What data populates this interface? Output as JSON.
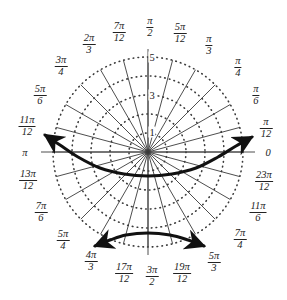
{
  "figure": {
    "center": {
      "x": 148,
      "y": 152
    },
    "outer_radius": 95,
    "colors": {
      "grid": "#3a3a3a",
      "curve": "#111111",
      "text": "#222222",
      "background": "#ffffff"
    }
  },
  "chart_data": {
    "type": "line",
    "coordinate_system": "polar",
    "title": "",
    "xlabel": "",
    "ylabel": "",
    "angle_unit": "radians",
    "grid": true,
    "legend": null,
    "radial_ticks": [
      {
        "value": 1,
        "label": "1"
      },
      {
        "value": 2,
        "label": ""
      },
      {
        "value": 3,
        "label": "3"
      },
      {
        "value": 4,
        "label": ""
      },
      {
        "value": 5,
        "label": "5"
      }
    ],
    "rlim": [
      0,
      5
    ],
    "angular_tick_count": 24,
    "angular_ticks": [
      {
        "angle_deg": 0,
        "label_num": "0",
        "label_den": ""
      },
      {
        "angle_deg": 15,
        "label_num": "π",
        "label_den": "12"
      },
      {
        "angle_deg": 30,
        "label_num": "π",
        "label_den": "6"
      },
      {
        "angle_deg": 45,
        "label_num": "π",
        "label_den": "4"
      },
      {
        "angle_deg": 60,
        "label_num": "π",
        "label_den": "3"
      },
      {
        "angle_deg": 75,
        "label_num": "5π",
        "label_den": "12"
      },
      {
        "angle_deg": 90,
        "label_num": "π",
        "label_den": "2"
      },
      {
        "angle_deg": 105,
        "label_num": "7π",
        "label_den": "12"
      },
      {
        "angle_deg": 120,
        "label_num": "2π",
        "label_den": "3"
      },
      {
        "angle_deg": 135,
        "label_num": "3π",
        "label_den": "4"
      },
      {
        "angle_deg": 150,
        "label_num": "5π",
        "label_den": "6"
      },
      {
        "angle_deg": 165,
        "label_num": "11π",
        "label_den": "12"
      },
      {
        "angle_deg": 180,
        "label_num": "π",
        "label_den": ""
      },
      {
        "angle_deg": 195,
        "label_num": "13π",
        "label_den": "12"
      },
      {
        "angle_deg": 210,
        "label_num": "7π",
        "label_den": "6"
      },
      {
        "angle_deg": 225,
        "label_num": "5π",
        "label_den": "4"
      },
      {
        "angle_deg": 240,
        "label_num": "4π",
        "label_den": "3"
      },
      {
        "angle_deg": 255,
        "label_num": "17π",
        "label_den": "12"
      },
      {
        "angle_deg": 270,
        "label_num": "3π",
        "label_den": "2"
      },
      {
        "angle_deg": 285,
        "label_num": "19π",
        "label_den": "12"
      },
      {
        "angle_deg": 300,
        "label_num": "5π",
        "label_den": "3"
      },
      {
        "angle_deg": 315,
        "label_num": "7π",
        "label_den": "4"
      },
      {
        "angle_deg": 330,
        "label_num": "11π",
        "label_den": "6"
      },
      {
        "angle_deg": 345,
        "label_num": "23π",
        "label_den": "12"
      }
    ],
    "curves": [
      {
        "name": "upper-branch",
        "arrow_start": true,
        "arrow_end": true,
        "points_px": [
          [
            45,
            135
          ],
          [
            60,
            145
          ],
          [
            78,
            157
          ],
          [
            100,
            168
          ],
          [
            124,
            174
          ],
          [
            148,
            176
          ],
          [
            172,
            174
          ],
          [
            196,
            168
          ],
          [
            218,
            157
          ],
          [
            236,
            146
          ],
          [
            252,
            137
          ]
        ]
      },
      {
        "name": "lower-branch",
        "arrow_start": true,
        "arrow_end": true,
        "points_px": [
          [
            95,
            246
          ],
          [
            110,
            240
          ],
          [
            126,
            235
          ],
          [
            148,
            233
          ],
          [
            170,
            235
          ],
          [
            188,
            240
          ],
          [
            204,
            246
          ]
        ]
      }
    ]
  },
  "labels": {
    "radial": [
      {
        "text": "5",
        "x": 152,
        "y": 57
      },
      {
        "text": "3",
        "x": 152,
        "y": 95
      },
      {
        "text": "1",
        "x": 152,
        "y": 132
      }
    ],
    "angular_positions": [
      {
        "id": "ang-0",
        "num": "0",
        "den": "",
        "x": 268,
        "y": 152
      },
      {
        "id": "ang-pi12",
        "num": "π",
        "den": "12",
        "x": 266,
        "y": 128
      },
      {
        "id": "ang-pi6",
        "num": "π",
        "den": "6",
        "x": 256,
        "y": 95
      },
      {
        "id": "ang-pi4",
        "num": "π",
        "den": "4",
        "x": 238,
        "y": 67
      },
      {
        "id": "ang-pi3",
        "num": "π",
        "den": "3",
        "x": 209,
        "y": 45
      },
      {
        "id": "ang-5pi12",
        "num": "5π",
        "den": "12",
        "x": 180,
        "y": 33
      },
      {
        "id": "ang-pi2",
        "num": "π",
        "den": "2",
        "x": 150,
        "y": 27
      },
      {
        "id": "ang-7pi12",
        "num": "7π",
        "den": "12",
        "x": 119,
        "y": 32
      },
      {
        "id": "ang-2pi3",
        "num": "2π",
        "den": "3",
        "x": 89,
        "y": 44
      },
      {
        "id": "ang-3pi4",
        "num": "3π",
        "den": "4",
        "x": 61,
        "y": 66
      },
      {
        "id": "ang-5pi6",
        "num": "5π",
        "den": "6",
        "x": 40,
        "y": 95
      },
      {
        "id": "ang-11pi12",
        "num": "11π",
        "den": "12",
        "x": 27,
        "y": 126
      },
      {
        "id": "ang-pi",
        "num": "π",
        "den": "",
        "x": 25,
        "y": 152
      },
      {
        "id": "ang-13pi12",
        "num": "13π",
        "den": "12",
        "x": 28,
        "y": 180
      },
      {
        "id": "ang-7pi6",
        "num": "7π",
        "den": "6",
        "x": 41,
        "y": 212
      },
      {
        "id": "ang-5pi4",
        "num": "5π",
        "den": "4",
        "x": 63,
        "y": 240
      },
      {
        "id": "ang-4pi3",
        "num": "4π",
        "den": "3",
        "x": 91,
        "y": 261
      },
      {
        "id": "ang-17pi12",
        "num": "17π",
        "den": "12",
        "x": 124,
        "y": 273
      },
      {
        "id": "ang-3pi2",
        "num": "3π",
        "den": "2",
        "x": 152,
        "y": 276
      },
      {
        "id": "ang-19pi12",
        "num": "19π",
        "den": "12",
        "x": 182,
        "y": 273
      },
      {
        "id": "ang-5pi3",
        "num": "5π",
        "den": "3",
        "x": 214,
        "y": 262
      },
      {
        "id": "ang-7pi4",
        "num": "7π",
        "den": "4",
        "x": 240,
        "y": 239
      },
      {
        "id": "ang-11pi6",
        "num": "11π",
        "den": "6",
        "x": 258,
        "y": 212
      },
      {
        "id": "ang-23pi12",
        "num": "23π",
        "den": "12",
        "x": 264,
        "y": 181
      }
    ]
  }
}
